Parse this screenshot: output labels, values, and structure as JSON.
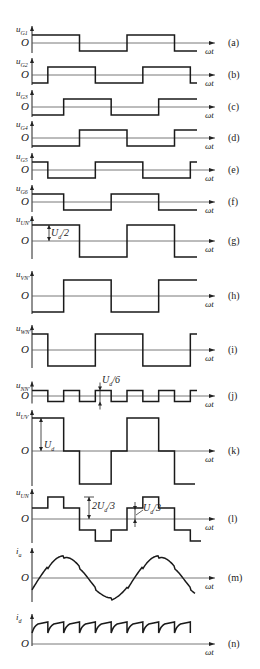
{
  "figure": {
    "x_axis_label": "ωt",
    "origin_label": "O",
    "panels": [
      {
        "tag": "(a)",
        "ylabel": "u",
        "ysub": "G1",
        "type": "square",
        "phase_deg": 0
      },
      {
        "tag": "(b)",
        "ylabel": "u",
        "ysub": "G2",
        "type": "square",
        "phase_deg": 60
      },
      {
        "tag": "(c)",
        "ylabel": "u",
        "ysub": "G3",
        "type": "square",
        "phase_deg": 120
      },
      {
        "tag": "(d)",
        "ylabel": "u",
        "ysub": "G4",
        "type": "square",
        "phase_deg": 180
      },
      {
        "tag": "(e)",
        "ylabel": "u",
        "ysub": "G5",
        "type": "square",
        "phase_deg": 240
      },
      {
        "tag": "(f)",
        "ylabel": "u",
        "ysub": "G6",
        "type": "square",
        "phase_deg": 300
      },
      {
        "tag": "(g)",
        "ylabel": "u",
        "ysub": "UN'",
        "type": "square",
        "annotation": "Ud/2"
      },
      {
        "tag": "(h)",
        "ylabel": "u",
        "ysub": "VN'",
        "type": "square"
      },
      {
        "tag": "(i)",
        "ylabel": "u",
        "ysub": "WN'",
        "type": "square"
      },
      {
        "tag": "(j)",
        "ylabel": "u",
        "ysub": "NN'",
        "type": "square-3x",
        "annotation": "Ud/6"
      },
      {
        "tag": "(k)",
        "ylabel": "u",
        "ysub": "UV",
        "type": "quasi-square",
        "annotation": "Ud"
      },
      {
        "tag": "(l)",
        "ylabel": "u",
        "ysub": "UN",
        "type": "six-step",
        "annotations": [
          "2Ud/3",
          "Ud/3"
        ]
      },
      {
        "tag": "(m)",
        "ylabel": "i",
        "ysub": "a",
        "type": "current"
      },
      {
        "tag": "(n)",
        "ylabel": "i",
        "ysub": "d",
        "type": "dc-ripple"
      }
    ],
    "annotations": {
      "g": {
        "text": "U",
        "sub": "d",
        "tail": "/2"
      },
      "j": {
        "text": "U",
        "sub": "d",
        "tail": "/6"
      },
      "k": {
        "text": "U",
        "sub": "d",
        "tail": ""
      },
      "l1": {
        "text": "2U",
        "sub": "d",
        "tail": "/3"
      },
      "l2": {
        "text": "U",
        "sub": "d",
        "tail": "/3"
      }
    },
    "caption": ""
  }
}
